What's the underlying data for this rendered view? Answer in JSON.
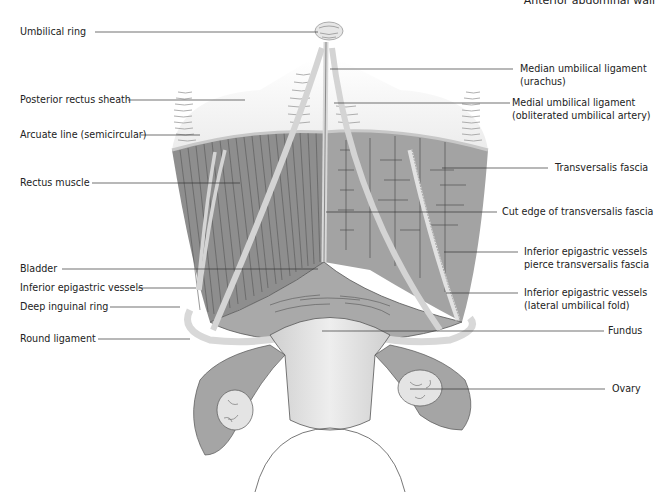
{
  "header": {
    "title": "Anterior abdominal wall"
  },
  "figure": {
    "colors": {
      "muscle": "#8c8c8c",
      "muscle_dark": "#6f6f6f",
      "fascia": "#a4a4a4",
      "sheath": "#f0f0f0",
      "ligament": "#d8d8d8",
      "uterus": "#dcdcdc",
      "line": "#333333"
    },
    "labels_left": [
      {
        "id": "umbilical-ring",
        "text": "Umbilical ring"
      },
      {
        "id": "posterior-rectus-sheath",
        "text": "Posterior rectus sheath"
      },
      {
        "id": "arcuate-line",
        "text": "Arcuate line (semicircular)"
      },
      {
        "id": "rectus-muscle",
        "text": "Rectus muscle"
      },
      {
        "id": "bladder",
        "text": "Bladder"
      },
      {
        "id": "inferior-epigastric-vessels-left",
        "text": "Inferior epigastric vessels"
      },
      {
        "id": "deep-inguinal-ring",
        "text": "Deep inguinal ring"
      },
      {
        "id": "round-ligament",
        "text": "Round ligament"
      }
    ],
    "labels_right": [
      {
        "id": "median-umbilical-ligament",
        "line1": "Median umbilical ligament",
        "line2": "(urachus)"
      },
      {
        "id": "medial-umbilical-ligament",
        "line1": "Medial umbilical ligament",
        "line2": "(obliterated umbilical artery)"
      },
      {
        "id": "transversalis-fascia",
        "line1": "Transversalis fascia",
        "line2": ""
      },
      {
        "id": "cut-edge-transversalis-fascia",
        "line1": "Cut edge of transversalis fascia",
        "line2": ""
      },
      {
        "id": "inferior-epigastric-pierce",
        "line1": "Inferior epigastric vessels",
        "line2": "pierce transversalis fascia"
      },
      {
        "id": "inferior-epigastric-lateral",
        "line1": "Inferior epigastric vessels",
        "line2": "(lateral umbilical fold)"
      },
      {
        "id": "fundus",
        "line1": "Fundus",
        "line2": ""
      },
      {
        "id": "ovary",
        "line1": "Ovary",
        "line2": ""
      }
    ]
  }
}
